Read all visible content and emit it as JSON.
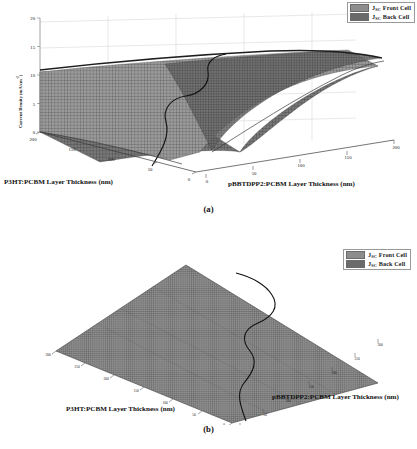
{
  "figure": {
    "panels": [
      {
        "id": "a",
        "caption": "(a)",
        "legend": [
          {
            "label_main": "J",
            "label_sub": "SC",
            "label_rest": " Front Cell",
            "color": "#8d8d8d",
            "name": "jsc-front-cell"
          },
          {
            "label_main": "J",
            "label_sub": "SC",
            "label_rest": " Back Cell",
            "color": "#6a6a6a",
            "name": "jsc-back-cell"
          }
        ],
        "y_axis": {
          "title_main": "Current Density (mA/cm",
          "title_sup": "-2",
          "title_end": ")",
          "ticks": [
            "0",
            "5",
            "10",
            "15",
            "20"
          ],
          "min": 0,
          "max": 20
        },
        "x_axis_left": {
          "title": "P3HT:PCBM Layer Thickness (nm)",
          "ticks": [
            "200",
            "150",
            "100",
            "50",
            "0"
          ],
          "min": 0,
          "max": 200
        },
        "x_axis_right": {
          "title": "pBBTDPP2:PCBM Layer Thickness (nm)",
          "ticks": [
            "0",
            "50",
            "100",
            "150",
            "200"
          ],
          "min": 0,
          "max": 200
        }
      },
      {
        "id": "b",
        "caption": "(b)",
        "legend": [
          {
            "label_main": "J",
            "label_sub": "SC",
            "label_rest": " Front Cell",
            "color": "#8d8d8d",
            "name": "jsc-front-cell"
          },
          {
            "label_main": "J",
            "label_sub": "SC",
            "label_rest": " Back Cell",
            "color": "#6a6a6a",
            "name": "jsc-back-cell"
          }
        ],
        "x_axis_left": {
          "title": "P3HT:PCBM Layer Thickness (nm)",
          "ticks": [
            "300",
            "250",
            "200",
            "150",
            "100",
            "50",
            "0"
          ],
          "min": 0,
          "max": 300
        },
        "x_axis_right": {
          "title": "pBBTDPP2:PCBM Layer Thickness (nm)",
          "ticks": [
            "0",
            "50",
            "100",
            "150",
            "200",
            "250",
            "300"
          ],
          "min": 0,
          "max": 300
        }
      }
    ]
  },
  "chart_data": [
    {
      "type": "surface",
      "panel": "a",
      "title": "",
      "xlabel": "P3HT:PCBM Layer Thickness (nm)",
      "ylabel": "pBBTDPP2:PCBM Layer Thickness (nm)",
      "zlabel": "Current Density (mA/cm-2)",
      "xlim": [
        0,
        200
      ],
      "ylim": [
        0,
        200
      ],
      "zlim": [
        0,
        20
      ],
      "xticks": [
        0,
        50,
        100,
        150,
        200
      ],
      "yticks": [
        0,
        50,
        100,
        150,
        200
      ],
      "zticks": [
        0,
        5,
        10,
        15,
        20
      ],
      "grid": true,
      "legend_position": "top-right",
      "series": [
        {
          "name": "JSC Front Cell",
          "color": "#8d8d8d",
          "description": "Saddle surface rising with P3HT thickness, saturating near 13 mA/cm-2",
          "z_grid": [
            [
              0.0,
              3.2,
              6.1,
              8.3,
              9.9,
              11.0,
              11.8,
              12.3,
              12.6
            ],
            [
              0.0,
              3.3,
              6.3,
              8.6,
              10.2,
              11.3,
              12.1,
              12.6,
              12.9
            ],
            [
              0.0,
              3.4,
              6.5,
              8.8,
              10.5,
              11.6,
              12.4,
              12.9,
              13.1
            ],
            [
              0.0,
              3.5,
              6.6,
              9.0,
              10.7,
              11.8,
              12.6,
              13.0,
              13.2
            ],
            [
              0.0,
              3.5,
              6.7,
              9.1,
              10.8,
              11.9,
              12.7,
              13.1,
              13.3
            ],
            [
              0.0,
              3.5,
              6.7,
              9.1,
              10.8,
              12.0,
              12.7,
              13.1,
              13.3
            ],
            [
              0.0,
              3.5,
              6.7,
              9.1,
              10.9,
              12.0,
              12.8,
              13.2,
              13.4
            ],
            [
              0.0,
              3.5,
              6.7,
              9.2,
              10.9,
              12.0,
              12.8,
              13.2,
              13.4
            ],
            [
              0.0,
              3.5,
              6.8,
              9.2,
              10.9,
              12.1,
              12.8,
              13.2,
              13.4
            ]
          ]
        },
        {
          "name": "JSC Back Cell",
          "color": "#6a6a6a",
          "description": "Saddle surface rising with pBBTDPP2 thickness, mirror of front cell",
          "z_grid": [
            [
              0.0,
              0.0,
              0.0,
              0.0,
              0.0,
              0.0,
              0.0,
              0.0,
              0.0
            ],
            [
              3.2,
              3.3,
              3.4,
              3.5,
              3.5,
              3.5,
              3.5,
              3.5,
              3.5
            ],
            [
              6.1,
              6.3,
              6.5,
              6.6,
              6.7,
              6.7,
              6.7,
              6.7,
              6.8
            ],
            [
              8.3,
              8.6,
              8.8,
              9.0,
              9.1,
              9.1,
              9.1,
              9.2,
              9.2
            ],
            [
              9.9,
              10.2,
              10.5,
              10.7,
              10.8,
              10.8,
              10.9,
              10.9,
              10.9
            ],
            [
              11.0,
              11.3,
              11.6,
              11.8,
              11.9,
              12.0,
              12.0,
              12.0,
              12.1
            ],
            [
              11.8,
              12.1,
              12.4,
              12.6,
              12.7,
              12.7,
              12.8,
              12.8,
              12.8
            ],
            [
              12.3,
              12.6,
              12.9,
              13.0,
              13.1,
              13.1,
              13.2,
              13.2,
              13.2
            ],
            [
              12.6,
              12.9,
              13.1,
              13.2,
              13.3,
              13.3,
              13.4,
              13.4,
              13.4
            ]
          ]
        }
      ],
      "intersection_contour": {
        "name": "Current matching curve",
        "color": "#111111",
        "description": "Dark S-shaped curve where front and back cell photocurrents are equal"
      }
    },
    {
      "type": "surface",
      "panel": "b",
      "title": "",
      "xlabel": "P3HT:PCBM Layer Thickness (nm)",
      "ylabel": "pBBTDPP2:PCBM Layer Thickness (nm)",
      "zlabel": "",
      "xlim": [
        0,
        300
      ],
      "ylim": [
        0,
        300
      ],
      "xticks": [
        0,
        50,
        100,
        150,
        200,
        250,
        300
      ],
      "yticks": [
        0,
        50,
        100,
        150,
        200,
        250,
        300
      ],
      "grid": false,
      "legend_position": "top-right",
      "series": [
        {
          "name": "JSC Front Cell",
          "color": "#8d8d8d",
          "description": "Flat plane viewed top-down (min of the two currents)"
        },
        {
          "name": "JSC Back Cell",
          "color": "#6a6a6a",
          "description": "Flat plane viewed top-down (min of the two currents)"
        }
      ],
      "intersection_contour": {
        "name": "Current matching curve",
        "color": "#111111",
        "description": "Dark S-shaped matching curve projected on the plane"
      }
    }
  ]
}
